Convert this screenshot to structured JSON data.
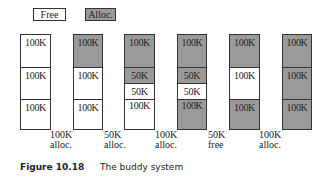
{
  "legend": {
    "free_label": "Free",
    "alloc_label": "Alloc."
  },
  "colors": {
    "free": "#ffffff",
    "alloc": "#9a9a9a",
    "border": "#333333"
  },
  "columns": [
    {
      "blocks": [
        {
          "label": "100K",
          "state": "free"
        },
        {
          "label": "100K",
          "state": "free"
        },
        {
          "label": "100K",
          "state": "free"
        }
      ]
    },
    {
      "blocks": [
        {
          "label": "100K",
          "state": "alloc"
        },
        {
          "label": "100K",
          "state": "free"
        },
        {
          "label": "100K",
          "state": "free"
        }
      ]
    },
    {
      "blocks": [
        {
          "label": "100K",
          "state": "alloc"
        },
        {
          "label": "50K",
          "state": "alloc"
        },
        {
          "label": "50K",
          "state": "free"
        },
        {
          "label": "100K",
          "state": "free"
        }
      ]
    },
    {
      "blocks": [
        {
          "label": "100K",
          "state": "alloc"
        },
        {
          "label": "50K",
          "state": "alloc"
        },
        {
          "label": "50K",
          "state": "free"
        },
        {
          "label": "100K",
          "state": "alloc"
        }
      ]
    },
    {
      "blocks": [
        {
          "label": "100K",
          "state": "alloc"
        },
        {
          "label": "100K",
          "state": "free"
        },
        {
          "label": "100K",
          "state": "alloc"
        }
      ]
    },
    {
      "blocks": [
        {
          "label": "100K",
          "state": "alloc"
        },
        {
          "label": "100K",
          "state": "alloc"
        },
        {
          "label": "100K",
          "state": "alloc"
        }
      ]
    }
  ],
  "transitions": [
    {
      "size": "100K",
      "action": "alloc."
    },
    {
      "size": "50K",
      "action": "alloc."
    },
    {
      "size": "100K",
      "action": "alloc."
    },
    {
      "size": "50K",
      "action": "free"
    },
    {
      "size": "100K",
      "action": "alloc."
    }
  ],
  "caption": {
    "number": "Figure 10.18",
    "text": "The buddy system"
  }
}
